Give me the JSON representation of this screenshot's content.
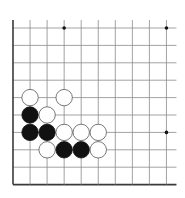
{
  "diagram": {
    "type": "go-board-fragment",
    "grid": {
      "columns": 10,
      "rows": 10,
      "origin_x": 13,
      "origin_y": 28,
      "spacing_x": 17.05,
      "spacing_y": 17.4,
      "right_extension": 10,
      "top_extension": 8,
      "line_color": "#8a8a8a",
      "edge_color": "#3a3a3a"
    },
    "star_points": [
      {
        "col": 3,
        "row": 0
      },
      {
        "col": 9,
        "row": 0
      },
      {
        "col": 9,
        "row": 6
      }
    ],
    "stones": [
      {
        "color": "white",
        "col": 1,
        "row": 4
      },
      {
        "color": "white",
        "col": 3,
        "row": 4
      },
      {
        "color": "black",
        "col": 1,
        "row": 5
      },
      {
        "color": "white",
        "col": 2,
        "row": 5
      },
      {
        "color": "black",
        "col": 1,
        "row": 6
      },
      {
        "color": "black",
        "col": 2,
        "row": 6
      },
      {
        "color": "white",
        "col": 3,
        "row": 6
      },
      {
        "color": "white",
        "col": 4,
        "row": 6
      },
      {
        "color": "white",
        "col": 5,
        "row": 6
      },
      {
        "color": "white",
        "col": 2,
        "row": 7
      },
      {
        "color": "black",
        "col": 3,
        "row": 7
      },
      {
        "color": "black",
        "col": 4,
        "row": 7
      },
      {
        "color": "white",
        "col": 5,
        "row": 7
      }
    ],
    "colors": {
      "black_stone": "#111111",
      "white_stone": "#ffffff",
      "stone_outline": "#555555"
    }
  }
}
